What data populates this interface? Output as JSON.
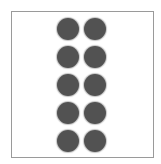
{
  "figure": {
    "columns": 2,
    "rows": 5,
    "dot_count": 10,
    "dot_color": "#525252",
    "border_color": "#9a9a9a",
    "background_color": "#ffffff"
  }
}
